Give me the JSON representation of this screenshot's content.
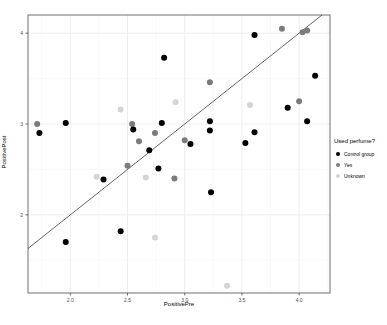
{
  "figure": {
    "background": "#ffffff"
  },
  "chart_data": {
    "type": "scatter",
    "title": "",
    "xlabel": "PositivePre",
    "ylabel": "PositivePost",
    "legend_title": "Used perfume?",
    "legend_position": "right",
    "grid": true,
    "x_domain": [
      1.63,
      4.27
    ],
    "y_domain": [
      1.14,
      4.2
    ],
    "x_tick_values": [
      2.0,
      2.5,
      3.0,
      3.5,
      4.0
    ],
    "x_tick_labels": [
      "2.0",
      "2.5",
      "3.0",
      "3.5",
      "4.0"
    ],
    "y_tick_values": [
      2,
      3,
      4
    ],
    "y_tick_labels": [
      "2",
      "3",
      "4"
    ],
    "x_minor_ticks": [
      1.75,
      2.25,
      2.75,
      3.25,
      3.75,
      4.25
    ],
    "y_minor_ticks": [
      1.5,
      2.5,
      3.5
    ],
    "reference_line": {
      "slope": 1,
      "intercept": 0,
      "color": "#3d3d3d",
      "width": 0.8
    },
    "point_radius": 3,
    "series": [
      {
        "name": "Control group",
        "color": "#000000",
        "points": [
          [
            1.73,
            2.9
          ],
          [
            1.96,
            3.01
          ],
          [
            1.96,
            1.7
          ],
          [
            2.29,
            2.39
          ],
          [
            2.44,
            1.82
          ],
          [
            2.55,
            2.94
          ],
          [
            2.69,
            2.71
          ],
          [
            2.77,
            2.51
          ],
          [
            2.8,
            3.01
          ],
          [
            2.82,
            3.73
          ],
          [
            3.05,
            2.78
          ],
          [
            3.22,
            3.03
          ],
          [
            3.22,
            2.93
          ],
          [
            3.23,
            2.25
          ],
          [
            3.53,
            2.79
          ],
          [
            3.61,
            2.91
          ],
          [
            3.61,
            3.98
          ],
          [
            3.9,
            3.18
          ],
          [
            4.07,
            3.03
          ],
          [
            4.14,
            3.53
          ]
        ]
      },
      {
        "name": "Yes",
        "color": "#7c7c7c",
        "points": [
          [
            1.71,
            3.0
          ],
          [
            2.5,
            2.54
          ],
          [
            2.54,
            3.0
          ],
          [
            2.6,
            2.81
          ],
          [
            2.74,
            2.9
          ],
          [
            2.91,
            2.4
          ],
          [
            3.0,
            2.82
          ],
          [
            3.22,
            3.46
          ],
          [
            3.85,
            4.05
          ],
          [
            4.0,
            3.25
          ],
          [
            4.03,
            4.01
          ],
          [
            4.07,
            4.03
          ]
        ]
      },
      {
        "name": "Unknown",
        "color": "#d5d5d5",
        "points": [
          [
            2.23,
            2.42
          ],
          [
            2.44,
            3.16
          ],
          [
            2.66,
            2.41
          ],
          [
            2.74,
            1.75
          ],
          [
            2.92,
            3.24
          ],
          [
            3.37,
            1.22
          ],
          [
            3.57,
            3.21
          ]
        ]
      }
    ]
  },
  "colors": {
    "grid_major": "#ebebeb",
    "grid_minor": "#f6f6f6",
    "panel_border": "#4d4d4d",
    "tick_mark": "#333333",
    "tick_label": "#4d4d4d",
    "axis_title": "#000000"
  },
  "panel": {
    "left": 28,
    "top": 15,
    "right": 330,
    "bottom": 293,
    "width_px": 387,
    "height_px": 325
  }
}
